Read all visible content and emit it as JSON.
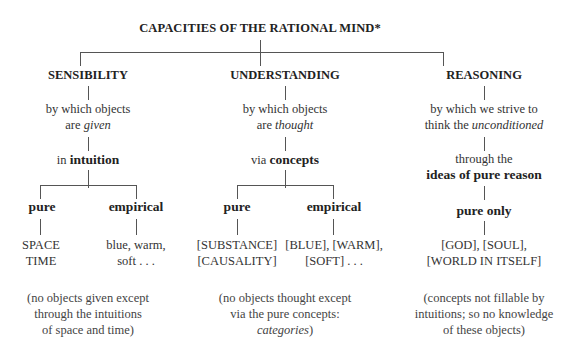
{
  "title": "CAPACITIES OF THE RATIONAL MIND*",
  "columns": [
    {
      "name": "SENSIBILITY",
      "desc_line1": "by which objects",
      "desc_line2_prefix": "are ",
      "desc_line2_emph": "given",
      "mode_prefix": "in ",
      "mode_bold": "intuition",
      "branches": [
        {
          "label": "pure",
          "items_line1": "SPACE",
          "items_line2": "TIME"
        },
        {
          "label": "empirical",
          "items_line1": "blue, warm,",
          "items_line2": "soft . . ."
        }
      ],
      "note_line1": "(no objects given except",
      "note_line2": "through the intuitions",
      "note_line3": "of space and time)"
    },
    {
      "name": "UNDERSTANDING",
      "desc_line1": "by which objects",
      "desc_line2_prefix": "are ",
      "desc_line2_emph": "thought",
      "mode_prefix": "via ",
      "mode_bold": "concepts",
      "branches": [
        {
          "label": "pure",
          "items_line1": "[SUBSTANCE]",
          "items_line2": "[CAUSALITY]"
        },
        {
          "label": "empirical",
          "items_line1": "[BLUE], [WARM],",
          "items_line2": "[SOFT] . . ."
        }
      ],
      "note_line1": "(no objects thought except",
      "note_line2": "via the pure concepts:",
      "note_line3_emph": "categories",
      "note_line3_suffix": ")"
    },
    {
      "name": "REASONING",
      "desc_line1": "by which we strive to",
      "desc_line2_prefix": "think the ",
      "desc_line2_emph": "unconditioned",
      "mode_line1": "through the",
      "mode_bold": "ideas of pure reason",
      "branches": [
        {
          "label": "pure only",
          "items_line1": "[GOD], [SOUL],",
          "items_line2": "[WORLD IN ITSELF]"
        }
      ],
      "note_line1": "(concepts not fillable by",
      "note_line2": "intuitions; so no knowledge",
      "note_line3": "of these objects)"
    }
  ]
}
